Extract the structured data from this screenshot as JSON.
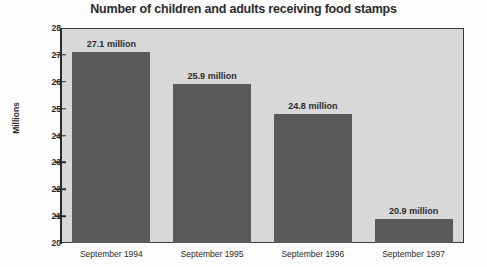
{
  "chart_data": {
    "type": "bar",
    "title": "Number of children and adults receiving food stamps",
    "xlabel": "",
    "ylabel": "Millions",
    "categories": [
      "September 1994",
      "September 1995",
      "September 1996",
      "September 1997"
    ],
    "values": [
      27.1,
      25.9,
      24.8,
      20.9
    ],
    "data_labels": [
      "27.1 million",
      "25.9 million",
      "24.8 million",
      "20.9 million"
    ],
    "ylim": [
      20,
      28
    ],
    "ytick_labels": [
      "28",
      "27",
      "26",
      "25",
      "24",
      "23",
      "22",
      "21",
      "20"
    ],
    "ytick_values": [
      28,
      27,
      26,
      25,
      24,
      23,
      22,
      21,
      20
    ],
    "grid": false,
    "legend": false,
    "bar_color": "#5a5a5a",
    "plot_background": "#d8d8d8",
    "axis_color": "#2a2a2a",
    "title_color": "#2b2b2b"
  }
}
